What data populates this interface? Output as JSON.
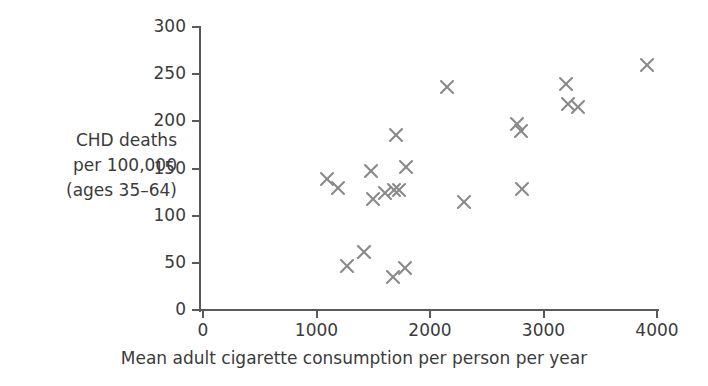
{
  "chart_data": {
    "type": "scatter",
    "title": "",
    "xlabel": "Mean adult cigarette consumption per person per year",
    "ylabel": "CHD deaths\nper 100,000\n(ages 35–64)",
    "xlim": [
      0,
      4000
    ],
    "ylim": [
      0,
      300
    ],
    "xticks": [
      0,
      1000,
      2000,
      3000,
      4000
    ],
    "yticks": [
      0,
      50,
      100,
      150,
      200,
      250,
      300
    ],
    "xtick_labels": [
      "0",
      "1000",
      "2000",
      "3000",
      "4000"
    ],
    "ytick_labels": [
      "0",
      "50",
      "100",
      "150",
      "200",
      "250",
      "300"
    ],
    "grid": false,
    "legend": false,
    "marker": "x",
    "marker_color": "#8a8a8a",
    "axis_color": "#5a5a5a",
    "text_color": "#3b3b3b",
    "background_color": "#ffffff",
    "points": [
      {
        "x": 1090,
        "y": 139
      },
      {
        "x": 1190,
        "y": 129
      },
      {
        "x": 1270,
        "y": 47
      },
      {
        "x": 1420,
        "y": 61
      },
      {
        "x": 1480,
        "y": 147
      },
      {
        "x": 1500,
        "y": 118
      },
      {
        "x": 1600,
        "y": 124
      },
      {
        "x": 1670,
        "y": 35
      },
      {
        "x": 1680,
        "y": 127
      },
      {
        "x": 1700,
        "y": 185
      },
      {
        "x": 1730,
        "y": 127
      },
      {
        "x": 1780,
        "y": 45
      },
      {
        "x": 1790,
        "y": 152
      },
      {
        "x": 2150,
        "y": 236
      },
      {
        "x": 2300,
        "y": 115
      },
      {
        "x": 2770,
        "y": 197
      },
      {
        "x": 2800,
        "y": 190
      },
      {
        "x": 2810,
        "y": 128
      },
      {
        "x": 3200,
        "y": 240
      },
      {
        "x": 3220,
        "y": 218
      },
      {
        "x": 3300,
        "y": 215
      },
      {
        "x": 3910,
        "y": 260
      }
    ]
  }
}
